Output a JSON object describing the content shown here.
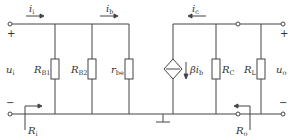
{
  "diagram": {
    "type": "small-signal equivalent circuit",
    "colors": {
      "wire": "#444444",
      "text": "#333333",
      "background": "#ffffff"
    },
    "currents": {
      "i_i": {
        "symbol": "i",
        "sub": "i",
        "direction": "right"
      },
      "i_b": {
        "symbol": "i",
        "sub": "b",
        "direction": "right"
      },
      "i_c": {
        "symbol": "i",
        "sub": "c",
        "direction": "left"
      }
    },
    "components": {
      "RB1": {
        "symbol": "R",
        "sub": "B1"
      },
      "RB2": {
        "symbol": "R",
        "sub": "B2"
      },
      "rbe": {
        "symbol": "r",
        "sub": "be"
      },
      "source": {
        "symbol": "βi",
        "sub": "b",
        "type": "dependent current source"
      },
      "RC": {
        "symbol": "R",
        "sub": "C"
      },
      "RL": {
        "symbol": "R",
        "sub": "L"
      }
    },
    "ports": {
      "input": {
        "voltage": "u",
        "vsub": "i",
        "plus": "+",
        "minus": "−",
        "resistance": "R",
        "rsub": "i"
      },
      "output": {
        "voltage": "u",
        "vsub": "o",
        "plus": "+",
        "minus": "−",
        "resistance": "R",
        "rsub": "o"
      }
    }
  }
}
